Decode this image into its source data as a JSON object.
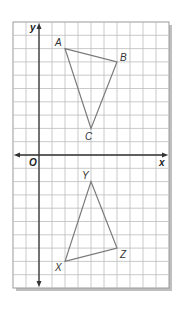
{
  "diagram": {
    "title": "",
    "canvas": {
      "width": 180,
      "height": 317
    },
    "grid": {
      "left": 13,
      "top": 22,
      "cols": 12,
      "rows": 20,
      "cell_w": 13,
      "cell_h": 13.3,
      "origin_col": 2,
      "origin_row": 10,
      "line_color": "#bdbdbd",
      "border_color": "#9a9a9a",
      "background": "#ffffff",
      "shadow_color": "#8a8a8a"
    },
    "axes": {
      "color": "#333333",
      "x_label": "x",
      "y_label": "y",
      "origin_label": "O",
      "x_range": [
        -2,
        10
      ],
      "y_range": [
        -10,
        10
      ]
    },
    "shapes": [
      {
        "name": "triangle-ABC",
        "stroke": "#7a7a7a",
        "vertices": [
          {
            "label": "A",
            "x": 2,
            "y": 8,
            "label_dx": -10,
            "label_dy": -3
          },
          {
            "label": "B",
            "x": 6,
            "y": 7,
            "label_dx": 3,
            "label_dy": -1
          },
          {
            "label": "C",
            "x": 4,
            "y": 2,
            "label_dx": -6,
            "label_dy": 12
          }
        ]
      },
      {
        "name": "triangle-XYZ",
        "stroke": "#7a7a7a",
        "vertices": [
          {
            "label": "X",
            "x": 2,
            "y": -8,
            "label_dx": -10,
            "label_dy": 10
          },
          {
            "label": "Y",
            "x": 4,
            "y": -2,
            "label_dx": -9,
            "label_dy": -3
          },
          {
            "label": "Z",
            "x": 6,
            "y": -7,
            "label_dx": 3,
            "label_dy": 10
          }
        ]
      }
    ]
  }
}
